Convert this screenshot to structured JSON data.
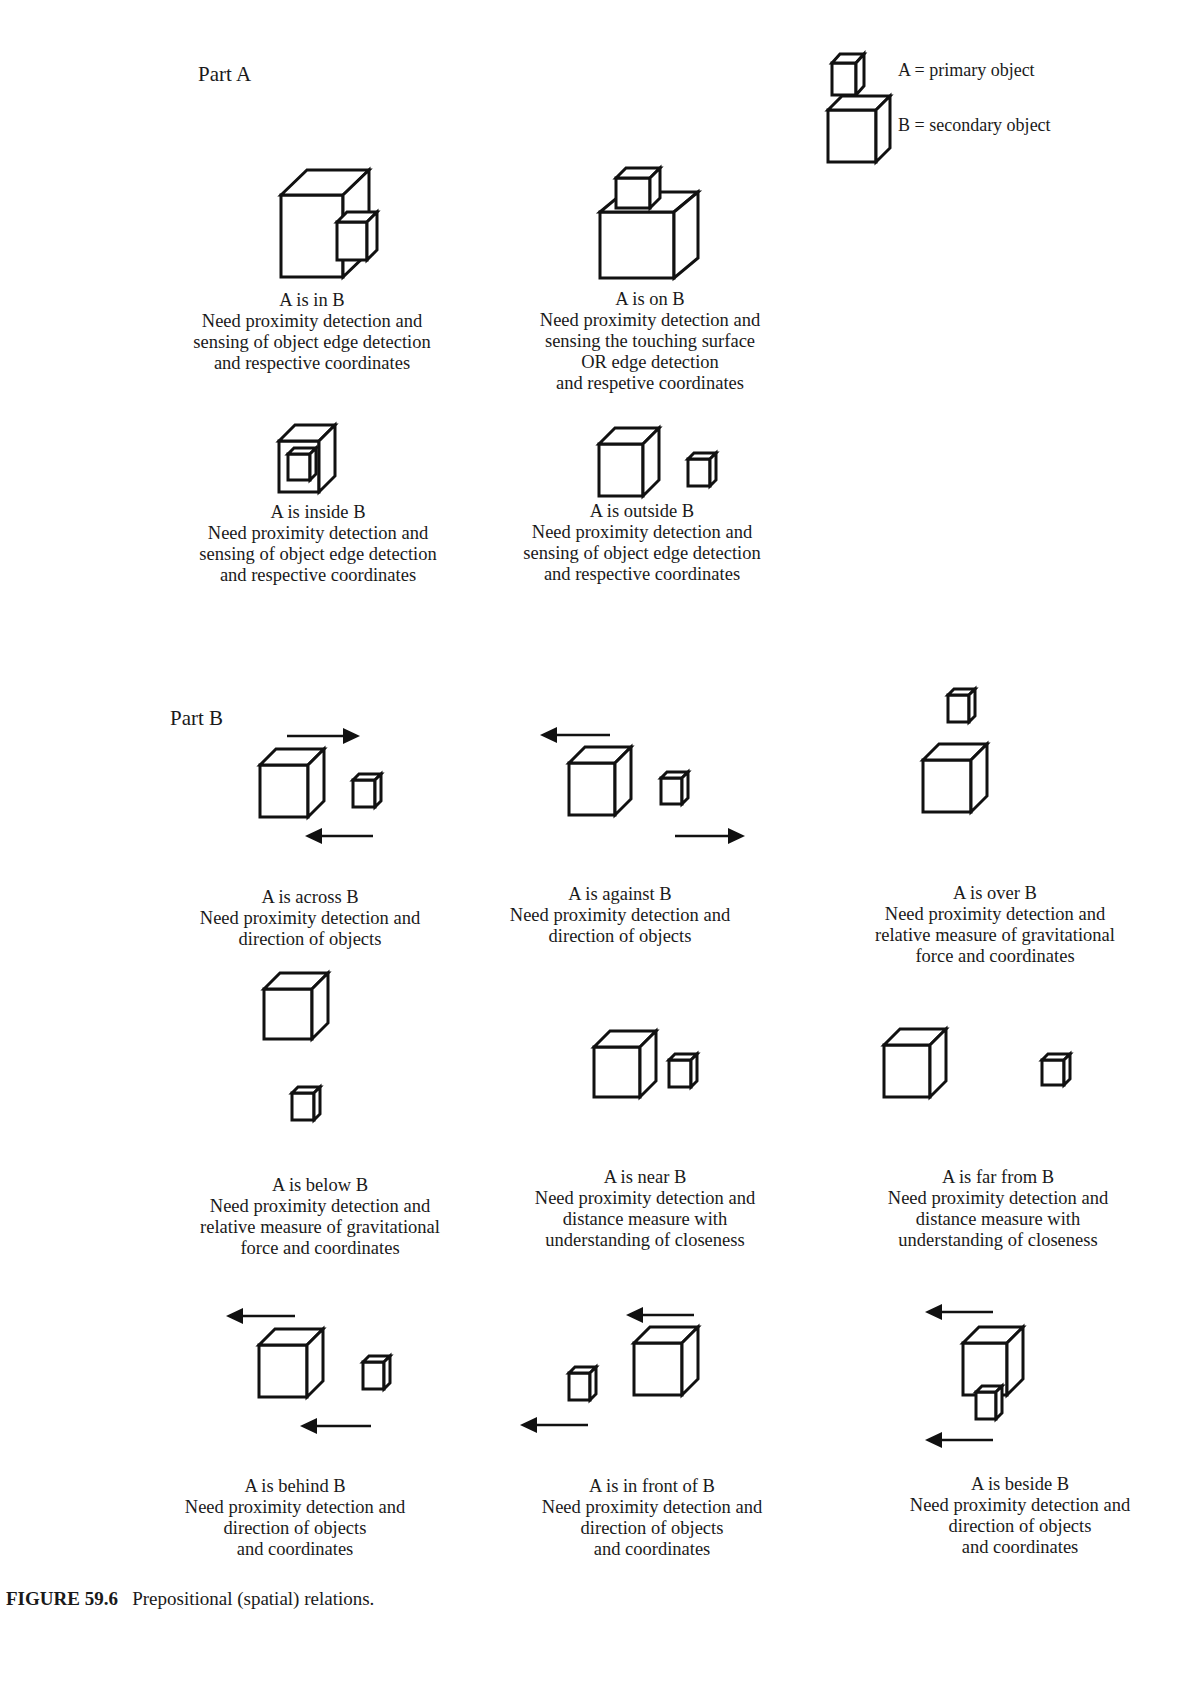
{
  "figure": {
    "number_label": "FIGURE 59.6",
    "caption": "Prepositional (spatial) relations."
  },
  "legend": {
    "primary": "A = primary object",
    "secondary": "B = secondary object"
  },
  "part_a": {
    "label": "Part A",
    "items": [
      {
        "title": "A is in B",
        "lines": [
          "Need proximity detection and",
          "sensing of object edge detection",
          "and respective coordinates"
        ]
      },
      {
        "title": "A is on B",
        "lines": [
          "Need proximity detection and",
          "sensing the touching surface",
          "OR edge detection",
          "and respetive coordinates"
        ]
      },
      {
        "title": "A is inside B",
        "lines": [
          "Need proximity detection and",
          "sensing of object edge detection",
          "and respective coordinates"
        ]
      },
      {
        "title": "A is outside B",
        "lines": [
          "Need proximity detection and",
          "sensing of object edge detection",
          "and respective coordinates"
        ]
      }
    ]
  },
  "part_b": {
    "label": "Part B",
    "items": [
      {
        "title": "A is across B",
        "lines": [
          "Need proximity detection and",
          "direction of objects"
        ]
      },
      {
        "title": "A is against B",
        "lines": [
          "Need proximity detection and",
          "direction of objects"
        ]
      },
      {
        "title": "A is over B",
        "lines": [
          "Need proximity detection and",
          "relative measure of gravitational",
          "force and coordinates"
        ]
      },
      {
        "title": "A is below B",
        "lines": [
          "Need proximity detection and",
          "relative measure of gravitational",
          "force and coordinates"
        ]
      },
      {
        "title": "A is near B",
        "lines": [
          "Need proximity detection and",
          "distance measure with",
          "understanding of closeness"
        ]
      },
      {
        "title": "A is far from B",
        "lines": [
          "Need proximity detection and",
          "distance measure with",
          "understanding of closeness"
        ]
      },
      {
        "title": "A is behind B",
        "lines": [
          "Need proximity detection and",
          "direction of objects",
          "and coordinates"
        ]
      },
      {
        "title": "A is in front of B",
        "lines": [
          "Need proximity detection and",
          "direction of objects",
          "and coordinates"
        ]
      },
      {
        "title": "A is beside B",
        "lines": [
          "Need proximity detection and",
          "direction of objects",
          "and coordinates"
        ]
      }
    ]
  },
  "icons": {
    "cube": "wireframe-cube",
    "arrow_left": "left-arrow",
    "arrow_right": "right-arrow"
  }
}
